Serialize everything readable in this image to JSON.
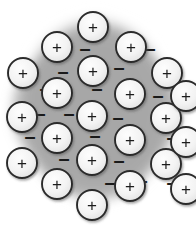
{
  "figure": {
    "background_color": "#ffffff",
    "sea_color": "#a6a6a6",
    "sea_edge_color": "#c9c9c9",
    "ion_fill_color": "#f2f2f2",
    "ion_stroke_color": "#2b2b2b",
    "symbol_color": "#1a1a1a",
    "ion_symbol": "+",
    "electron_symbol": "–",
    "ion_radius": 15,
    "ion_count": 22,
    "electron_count": 20,
    "sea_label": "electron-sea",
    "ion_label": "metal-cation",
    "electron_label": "delocalized-electron"
  },
  "chart_data": {
    "type": "scatter",
    "xlabel": "",
    "ylabel": "",
    "xlim": [
      0,
      196
    ],
    "ylim": [
      0,
      229
    ],
    "grid": false,
    "legend": "none",
    "series": [
      {
        "name": "metal cations",
        "marker": "circle-plus",
        "radius": 15,
        "points": [
          {
            "x": 93,
            "y": 27,
            "symbol": "+"
          },
          {
            "x": 57,
            "y": 47,
            "symbol": "+"
          },
          {
            "x": 131,
            "y": 47,
            "symbol": "+"
          },
          {
            "x": 23,
            "y": 73,
            "symbol": "+"
          },
          {
            "x": 93,
            "y": 71,
            "symbol": "+"
          },
          {
            "x": 167,
            "y": 73,
            "symbol": "+"
          },
          {
            "x": 57,
            "y": 93,
            "symbol": "+"
          },
          {
            "x": 130,
            "y": 94,
            "symbol": "+"
          },
          {
            "x": 22,
            "y": 117,
            "symbol": "+"
          },
          {
            "x": 92,
            "y": 116,
            "symbol": "+"
          },
          {
            "x": 166,
            "y": 118,
            "symbol": "+"
          },
          {
            "x": 57,
            "y": 138,
            "symbol": "+"
          },
          {
            "x": 130,
            "y": 140,
            "symbol": "+"
          },
          {
            "x": 22,
            "y": 163,
            "symbol": "+"
          },
          {
            "x": 92,
            "y": 160,
            "symbol": "+"
          },
          {
            "x": 166,
            "y": 164,
            "symbol": "+"
          },
          {
            "x": 57,
            "y": 184,
            "symbol": "+"
          },
          {
            "x": 130,
            "y": 186,
            "symbol": "+"
          },
          {
            "x": 92,
            "y": 205,
            "symbol": "+"
          },
          {
            "x": 186,
            "y": 96,
            "symbol": "+"
          },
          {
            "x": 186,
            "y": 142,
            "symbol": "+"
          },
          {
            "x": 186,
            "y": 189,
            "symbol": "+"
          }
        ]
      },
      {
        "name": "delocalized electrons",
        "marker": "minus",
        "points": [
          {
            "x": 85,
            "y": 48,
            "symbol": "–"
          },
          {
            "x": 119,
            "y": 67,
            "symbol": "–"
          },
          {
            "x": 63,
            "y": 71,
            "symbol": "–"
          },
          {
            "x": 45,
            "y": 88,
            "symbol": "–"
          },
          {
            "x": 97,
            "y": 88,
            "symbol": "–"
          },
          {
            "x": 158,
            "y": 95,
            "symbol": "–"
          },
          {
            "x": 176,
            "y": 93,
            "symbol": "–"
          },
          {
            "x": 69,
            "y": 113,
            "symbol": "–"
          },
          {
            "x": 118,
            "y": 117,
            "symbol": "–"
          },
          {
            "x": 30,
            "y": 136,
            "symbol": "–"
          },
          {
            "x": 95,
            "y": 135,
            "symbol": "–"
          },
          {
            "x": 172,
            "y": 137,
            "symbol": "–"
          },
          {
            "x": 64,
            "y": 158,
            "symbol": "–"
          },
          {
            "x": 119,
            "y": 160,
            "symbol": "–"
          },
          {
            "x": 85,
            "y": 161,
            "symbol": "–"
          },
          {
            "x": 110,
            "y": 182,
            "symbol": "–"
          },
          {
            "x": 142,
            "y": 180,
            "symbol": "–"
          },
          {
            "x": 172,
            "y": 182,
            "symbol": "–"
          },
          {
            "x": 40,
            "y": 113,
            "symbol": "–"
          },
          {
            "x": 150,
            "y": 48,
            "symbol": "–"
          }
        ]
      }
    ]
  }
}
